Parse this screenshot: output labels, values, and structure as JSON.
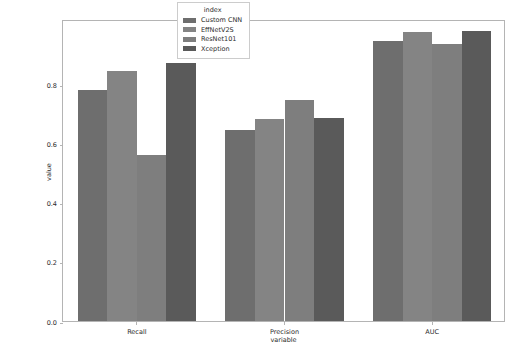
{
  "chart_data": {
    "type": "bar",
    "title": "",
    "xlabel": "variable",
    "ylabel": "value",
    "categories": [
      "Recall",
      "Precision",
      "AUC"
    ],
    "series": [
      {
        "name": "Custom CNN",
        "color": "#6e6e6e",
        "values": [
          0.78,
          0.645,
          0.945
        ]
      },
      {
        "name": "EffNetV2S",
        "color": "#848484",
        "values": [
          0.845,
          0.682,
          0.975
        ]
      },
      {
        "name": "ResNet101",
        "color": "#7e7e7e",
        "values": [
          0.56,
          0.748,
          0.935
        ]
      },
      {
        "name": "Xception",
        "color": "#5a5a5a",
        "values": [
          0.87,
          0.686,
          0.978
        ]
      }
    ],
    "ylim": [
      0.0,
      1.02
    ],
    "yticks": [
      "0.0",
      "0.2",
      "0.4",
      "0.6",
      "0.8"
    ],
    "ytick_values": [
      0.0,
      0.2,
      0.4,
      0.6,
      0.8
    ],
    "grid": false,
    "legend": {
      "title": "index",
      "position": "upper-center",
      "entries": [
        "Custom CNN",
        "EffNetV2S",
        "ResNet101",
        "Xception"
      ]
    }
  }
}
